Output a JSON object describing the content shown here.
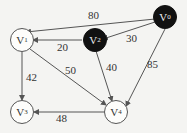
{
  "diagram": {
    "type": "weighted directed graph",
    "nodes": [
      {
        "id": "v0",
        "label": "V",
        "sub": "0",
        "fill": "dark"
      },
      {
        "id": "v1",
        "label": "V",
        "sub": "1",
        "fill": "light"
      },
      {
        "id": "v2",
        "label": "V",
        "sub": "2",
        "fill": "dark"
      },
      {
        "id": "v3",
        "label": "V",
        "sub": "3",
        "fill": "light"
      },
      {
        "id": "v4",
        "label": "V",
        "sub": "4",
        "fill": "light"
      }
    ],
    "edges": [
      {
        "from": "v0",
        "to": "v1",
        "weight": "80"
      },
      {
        "from": "v0",
        "to": "v2",
        "weight": "30"
      },
      {
        "from": "v0",
        "to": "v4",
        "weight": "85"
      },
      {
        "from": "v2",
        "to": "v1",
        "weight": "20"
      },
      {
        "from": "v2",
        "to": "v4",
        "weight": "40"
      },
      {
        "from": "v1",
        "to": "v3",
        "weight": "42"
      },
      {
        "from": "v1",
        "to": "v4",
        "weight": "50"
      },
      {
        "from": "v4",
        "to": "v3",
        "weight": "48"
      }
    ]
  }
}
